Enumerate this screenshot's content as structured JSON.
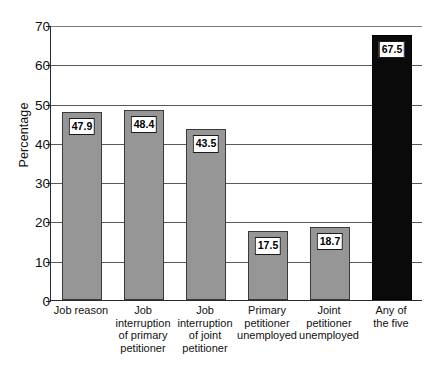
{
  "chart_data": {
    "type": "bar",
    "title": "",
    "xlabel": "",
    "ylabel": "Percentage",
    "ylim": [
      0,
      70
    ],
    "ytick_step": 10,
    "yticks": [
      0,
      10,
      20,
      30,
      40,
      50,
      60,
      70
    ],
    "grid": true,
    "legend": "none",
    "categories": [
      "Job reason",
      "Job interruption of primary petitioner",
      "Job interruption of joint petitioner",
      "Primary petitioner unemployed",
      "Joint petitioner unemployed",
      "Any of the five"
    ],
    "category_lines": [
      [
        "Job reason"
      ],
      [
        "Job",
        "interruption",
        "of primary",
        "petitioner"
      ],
      [
        "Job",
        "interruption",
        "of joint",
        "petitioner"
      ],
      [
        "Primary",
        "petitioner",
        "unemployed"
      ],
      [
        "Joint",
        "petitioner",
        "unemployed"
      ],
      [
        "Any of",
        "the five"
      ]
    ],
    "values": [
      47.9,
      48.4,
      43.5,
      17.5,
      18.7,
      67.5
    ],
    "value_labels": [
      "47.9",
      "48.4",
      "43.5",
      "17.5",
      "18.7",
      "67.5"
    ],
    "bar_colors": [
      "#969696",
      "#969696",
      "#969696",
      "#969696",
      "#969696",
      "#0a0a0a"
    ],
    "highlight_category": "Any of the five"
  },
  "axis": {
    "y_title": "Percentage",
    "y_tick_labels": [
      "70",
      "60",
      "50",
      "40",
      "30",
      "20",
      "10",
      "0"
    ]
  },
  "colors": {
    "bar_gray": "#969696",
    "bar_black": "#0a0a0a",
    "axis": "#2b2b2b",
    "gridline": "#5a5a5a",
    "background": "#ffffff"
  }
}
